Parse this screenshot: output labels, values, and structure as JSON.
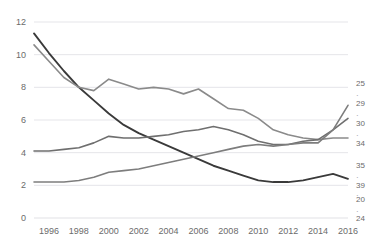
{
  "chart_data": {
    "type": "line",
    "title": "",
    "xlabel": "",
    "ylabel": "",
    "x": [
      1995,
      1996,
      1997,
      1998,
      1999,
      2000,
      2001,
      2002,
      2003,
      2004,
      2005,
      2006,
      2007,
      2008,
      2009,
      2010,
      2011,
      2012,
      2013,
      2014,
      2015,
      2016
    ],
    "xlim": [
      1995,
      2016
    ],
    "ylim": [
      0,
      12
    ],
    "yticks": [
      0,
      2,
      4,
      6,
      8,
      10,
      12
    ],
    "xticks": [
      1996,
      1998,
      2000,
      2002,
      2004,
      2006,
      2008,
      2010,
      2012,
      2014,
      2016
    ],
    "grid": true,
    "legend": "none",
    "right_axis_labels": [
      "25",
      "·",
      "29",
      "·",
      "30",
      "·",
      "34",
      "35",
      "·",
      "39",
      "·",
      "20",
      "·",
      "24"
    ],
    "series": [
      {
        "name": "series-dark",
        "color": "#3a3a3a",
        "values": [
          11.3,
          10.1,
          9.0,
          8.0,
          7.2,
          6.4,
          5.7,
          5.2,
          4.8,
          4.4,
          4.0,
          3.6,
          3.2,
          2.9,
          2.6,
          2.3,
          2.2,
          2.2,
          2.3,
          2.5,
          2.7,
          2.4
        ]
      },
      {
        "name": "series-upper-gray",
        "color": "#8a8a8a",
        "values": [
          10.6,
          9.6,
          8.6,
          8.0,
          7.8,
          8.5,
          8.2,
          7.9,
          8.0,
          7.9,
          7.6,
          7.9,
          7.3,
          6.7,
          6.6,
          6.1,
          5.4,
          5.1,
          4.9,
          4.8,
          4.9,
          4.9
        ]
      },
      {
        "name": "series-mid-gray",
        "color": "#6f6f6f",
        "values": [
          4.1,
          4.1,
          4.2,
          4.3,
          4.6,
          5.0,
          4.9,
          4.9,
          5.0,
          5.1,
          5.3,
          5.4,
          5.6,
          5.4,
          5.1,
          4.7,
          4.5,
          4.5,
          4.7,
          4.8,
          5.4,
          6.1
        ]
      },
      {
        "name": "series-bottom-gray",
        "color": "#7d7d7d",
        "values": [
          2.2,
          2.2,
          2.2,
          2.3,
          2.5,
          2.8,
          2.9,
          3.0,
          3.2,
          3.4,
          3.6,
          3.8,
          4.0,
          4.2,
          4.4,
          4.5,
          4.4,
          4.5,
          4.6,
          4.6,
          5.4,
          6.9
        ]
      }
    ]
  },
  "axis": {
    "y_tick_labels": [
      "12",
      "10",
      "8",
      "6",
      "4",
      "2",
      "0"
    ],
    "x_tick_labels": [
      "1996",
      "1998",
      "2000",
      "2002",
      "2004",
      "2006",
      "2008",
      "2010",
      "2012",
      "2014",
      "2016"
    ]
  },
  "right_labels": [
    {
      "text": "25",
      "y": 84
    },
    {
      "text": "·",
      "y": 96
    },
    {
      "text": "29",
      "y": 104
    },
    {
      "text": "·",
      "y": 116
    },
    {
      "text": "30",
      "y": 124
    },
    {
      "text": "·",
      "y": 136
    },
    {
      "text": "34",
      "y": 144
    },
    {
      "text": "35",
      "y": 166
    },
    {
      "text": "·",
      "y": 178
    },
    {
      "text": "39",
      "y": 186
    },
    {
      "text": "·",
      "y": 196
    },
    {
      "text": "20",
      "y": 200
    },
    {
      "text": "·",
      "y": 212
    },
    {
      "text": "24",
      "y": 219
    }
  ],
  "colors": {
    "grid": "#e2e2e6",
    "tick_text": "#6b6b6b",
    "background": "#ffffff"
  }
}
